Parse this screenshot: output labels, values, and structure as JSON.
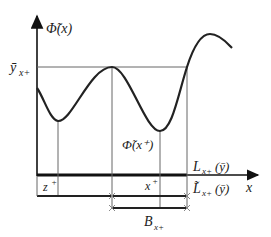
{
  "diagram": {
    "y_axis_label": "Φ̃(x)",
    "x_axis_label": "x",
    "y_level_label": "ȳ",
    "y_level_sub": "x+",
    "min_label": "Φ̃(x⁺)",
    "z_label": "z",
    "z_sup": "+",
    "xplus_label": "x",
    "xplus_sup": "+",
    "L_label": "L",
    "L_sub": "x+",
    "L_arg": "(ȳ)",
    "Ltilde_label": "L̃",
    "Ltilde_sub": "x+",
    "Ltilde_arg": "(ȳ)",
    "B_label": "B",
    "B_sub": "x+",
    "colors": {
      "curve": "#222222",
      "lines": "#555555",
      "axis": "#111111"
    }
  }
}
